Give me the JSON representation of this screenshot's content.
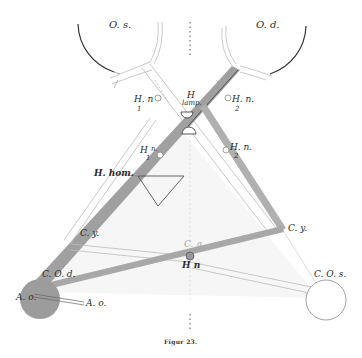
{
  "figure": {
    "caption": "Figur 23.",
    "colors": {
      "background": "#ffffff",
      "ink": "#2a2a2a",
      "shaded_rod": "#9a9a9a",
      "shaded_rod_dark": "#7a7a7a",
      "shaded_lens": "#9c9c9c",
      "triangle_fill": "#f4f4f4"
    }
  },
  "labels": {
    "os": "O. s.",
    "od": "O. d.",
    "h_n_1": "H. n",
    "h_n_1_sub": "1",
    "h_lamp": "H",
    "h_lamp_sub": "lamp.",
    "h_n_2": "H. n.",
    "h_n_2_sub": "2",
    "h1_n": "H",
    "h1_n_sub": "1",
    "h1_n_suffix": "n.",
    "h2_n": "H. n.",
    "h2_n_sub": "2",
    "h_hom": "H. hom.",
    "c_y_left": "C. y.",
    "c_y_right": "C. y.",
    "c_q": "C. q.",
    "h_n_center": "H n",
    "c_o_d": "C. O. d.",
    "c_o_s": "C. O. s.",
    "a_o_left": "A. o.",
    "a_o_right": "A. o."
  }
}
